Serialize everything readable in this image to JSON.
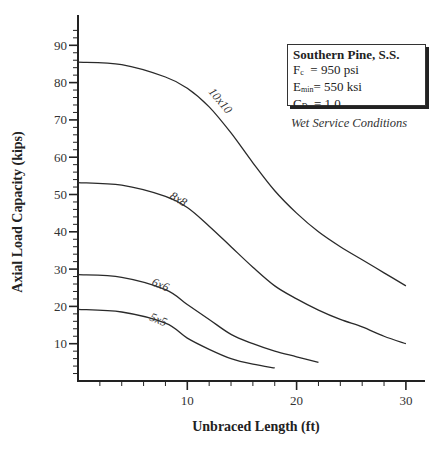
{
  "chart_data": {
    "type": "line",
    "title": "",
    "xlabel": "Unbraced Length (ft)",
    "ylabel": "Axial Load Capacity (kips)",
    "xlim": [
      0,
      32
    ],
    "ylim": [
      0,
      95
    ],
    "x_ticks": [
      10,
      20,
      30
    ],
    "y_ticks": [
      10,
      20,
      30,
      40,
      50,
      60,
      70,
      80,
      90
    ],
    "grid": false,
    "series": [
      {
        "name": "10x10",
        "x": [
          0,
          4,
          8,
          10,
          12,
          14,
          16,
          18,
          20,
          22,
          24,
          26,
          28,
          30
        ],
        "values": [
          85.5,
          84.8,
          81.5,
          78.5,
          73.5,
          66.5,
          58.5,
          51,
          45,
          40,
          36,
          32.5,
          29,
          25.5
        ]
      },
      {
        "name": "8x8",
        "x": [
          0,
          4,
          8,
          10,
          12,
          14,
          16,
          18,
          20,
          22,
          24,
          26,
          28,
          30
        ],
        "values": [
          53.2,
          52.5,
          49.5,
          46.5,
          41.5,
          36,
          30.5,
          25.5,
          22,
          19,
          16.5,
          14.5,
          12,
          10
        ]
      },
      {
        "name": "6x6",
        "x": [
          0,
          4,
          8,
          10,
          12,
          14,
          16,
          18,
          20,
          22
        ],
        "values": [
          28.5,
          27.8,
          24.5,
          20.5,
          16.5,
          12.5,
          10,
          8,
          6.5,
          5
        ]
      },
      {
        "name": "5x5",
        "x": [
          0,
          4,
          8,
          10,
          12,
          14,
          16,
          18
        ],
        "values": [
          19.2,
          18.5,
          15.5,
          11.5,
          8.5,
          6,
          4.5,
          3.5
        ]
      }
    ],
    "annotations": [
      "10x10",
      "8x8",
      "6x6",
      "5x5"
    ],
    "legend": {
      "position": "upper-right",
      "title": "Southern Pine, S.S.",
      "lines": [
        {
          "label": "F",
          "sub": "c",
          "value": "  = 950 psi"
        },
        {
          "label": "E",
          "sub": "min",
          "value": "= 550 ksi"
        },
        {
          "label": "C",
          "sub": "D",
          "value": "  = 1.0"
        }
      ],
      "note": "Wet Service Conditions"
    }
  }
}
